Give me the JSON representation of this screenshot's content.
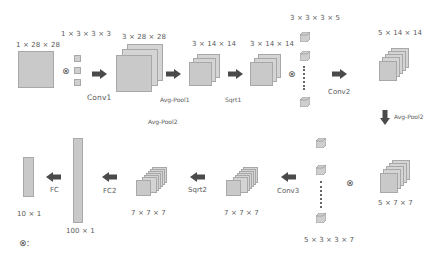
{
  "diagram": {
    "type": "cnn-architecture",
    "colors": {
      "feature_map_fill": "#c9c9c9",
      "feature_map_border": "#a8a8a8",
      "arrow": "#4a4a4a",
      "text": "#5a5a5a"
    },
    "stages": {
      "input": {
        "label": "1 × 28 × 28"
      },
      "kernel1": {
        "label": "1 × 3 × 3 × 3"
      },
      "conv1": {
        "label": "Conv1"
      },
      "fmap1": {
        "label": "3 × 28 × 28"
      },
      "avgpool1": {
        "label": "Avg-Pool1"
      },
      "avgpool2_note": {
        "label": "Avg-Pool2"
      },
      "fmap2": {
        "label": "3 × 14 × 14"
      },
      "sqrt1": {
        "label": "Sqrt1"
      },
      "fmap3": {
        "label": "3 × 14 × 14"
      },
      "kernel2": {
        "label": "3 × 3 × 3 × 5"
      },
      "conv2": {
        "label": "Conv2"
      },
      "fmap4": {
        "label": "5 × 14 × 14"
      },
      "avgpool2": {
        "label": "Avg-Pool2"
      },
      "fmap5": {
        "label": "5 × 7 × 7"
      },
      "kernel3": {
        "label": "5 × 3 × 3 × 7"
      },
      "conv3": {
        "label": "Conv3"
      },
      "fmap6": {
        "label": "7 × 7 × 7"
      },
      "sqrt2": {
        "label": "Sqrt2"
      },
      "fmap7": {
        "label": "7 × 7 × 7"
      },
      "fc2": {
        "label": "FC2"
      },
      "vec100": {
        "label": "100 × 1"
      },
      "fc": {
        "label": "FC"
      },
      "vec10": {
        "label": "10 × 1"
      }
    },
    "operators": {
      "convolution_symbol": "⊗",
      "legend": "⊗:"
    }
  }
}
